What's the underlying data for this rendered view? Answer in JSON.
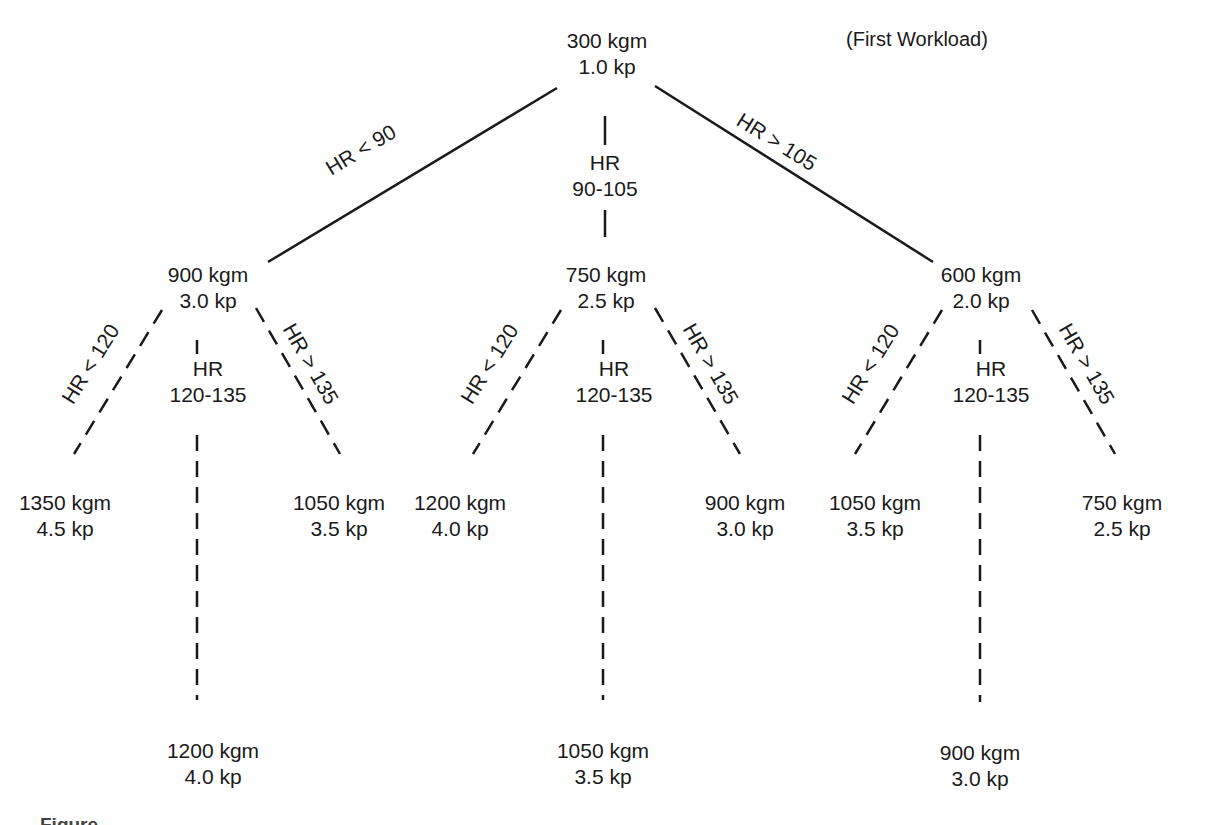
{
  "diagram": {
    "note": "(First Workload)",
    "root": {
      "work": "300 kgm",
      "load": "1.0 kp"
    },
    "level1_branches": [
      {
        "condition": "HR < 90",
        "work": "900 kgm",
        "load": "3.0 kp"
      },
      {
        "condition_line1": "HR",
        "condition_line2": "90-105",
        "work": "750 kgm",
        "load": "2.5 kp"
      },
      {
        "condition": "HR > 105",
        "work": "600 kgm",
        "load": "2.0 kp"
      }
    ],
    "level2_groups": [
      {
        "parent": "900 kgm",
        "low": {
          "condition": "HR < 120",
          "work": "1350 kgm",
          "load": "4.5 kp"
        },
        "mid": {
          "condition_line1": "HR",
          "condition_line2": "120-135",
          "work": "1200 kgm",
          "load": "4.0 kp"
        },
        "high": {
          "condition": "HR > 135",
          "work": "1050 kgm",
          "load": "3.5 kp"
        }
      },
      {
        "parent": "750 kgm",
        "low": {
          "condition": "HR < 120",
          "work": "1200 kgm",
          "load": "4.0 kp"
        },
        "mid": {
          "condition_line1": "HR",
          "condition_line2": "120-135",
          "work": "1050 kgm",
          "load": "3.5 kp"
        },
        "high": {
          "condition": "HR > 135",
          "work": "900 kgm",
          "load": "3.0 kp"
        }
      },
      {
        "parent": "600 kgm",
        "low": {
          "condition": "HR < 120",
          "work": "1050 kgm",
          "load": "3.5 kp"
        },
        "mid": {
          "condition_line1": "HR",
          "condition_line2": "120-135",
          "work": "900 kgm",
          "load": "3.0 kp"
        },
        "high": {
          "condition": "HR > 135",
          "work": "750 kgm",
          "load": "2.5 kp"
        }
      }
    ]
  },
  "caption": {
    "visible_text": "Figure"
  },
  "colors": {
    "ink": "#1a1a1a",
    "background": "#ffffff",
    "caption": "#444444"
  }
}
